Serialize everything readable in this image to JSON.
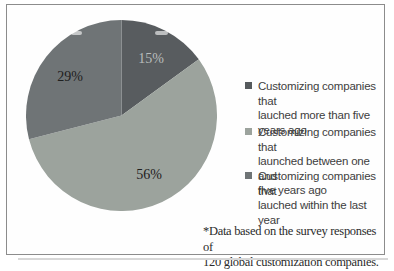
{
  "chart_data": {
    "type": "pie",
    "title": "",
    "unit": "%",
    "direction": "clockwise",
    "start_angle_deg": 0,
    "legend_position": "right",
    "slices": [
      {
        "label": "Customizing companies that lauched more than five years ago",
        "value": 15,
        "display": "15%",
        "color": "#585c5f",
        "label_color": "#b9bdbd"
      },
      {
        "label": "Customizing companies that launched between one and five years ago",
        "value": 56,
        "display": "56%",
        "color": "#9ca39d",
        "label_color": "#1e2020"
      },
      {
        "label": "Customizing companies that lauched within the last year",
        "value": 29,
        "display": "29%",
        "color": "#6f7476",
        "label_color": "#1e2020"
      }
    ],
    "legend": {
      "items": [
        {
          "label": "Customizing companies that\nlauched more than five\nyears ago",
          "color": "#565a5d"
        },
        {
          "label": "Customizing companies that\nlaunched between one and\nfive years ago",
          "color": "#9ca39d"
        },
        {
          "label": "Customizing companies that\nlauched within the last year",
          "color": "#6f7476"
        }
      ]
    },
    "footnote": "*Data based on the survey responses of\n120 global customization companies."
  }
}
